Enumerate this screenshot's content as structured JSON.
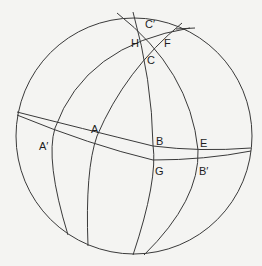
{
  "diagram": {
    "type": "spherical-geometry",
    "colors": {
      "background": "#f4f4f2",
      "stroke": "#3a3a3a",
      "text": "#1e1e1e"
    },
    "labels": {
      "C_prime": "C′",
      "H": "H",
      "F": "F",
      "C": "C",
      "A_prime": "A′",
      "A": "A",
      "B": "B",
      "E": "E",
      "G": "G",
      "B_prime": "B′"
    }
  }
}
